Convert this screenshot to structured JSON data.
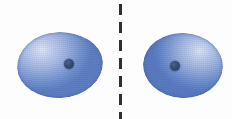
{
  "figure": {
    "type": "scientific-diagram",
    "background_color": "#ffffff",
    "width": 232,
    "height": 119
  },
  "mirror_plane": {
    "name": "mirror-plane",
    "orientation": "vertical",
    "style": "dashed",
    "color": "#2f2f2f",
    "x_position": 120,
    "dash_length": 11,
    "dash_gap": 7,
    "line_width": 3
  },
  "lobes": [
    {
      "id": "left",
      "label": "",
      "fill_color": "#8aa4d6",
      "highlight_color": "#dfe6f6",
      "edge_color": "#5f7fc2",
      "center_x": 60,
      "center_y": 65,
      "width": 86,
      "height": 66,
      "nucleus": {
        "label": "",
        "color": "#2b3f63",
        "x": 69,
        "y": 64,
        "diameter": 10
      }
    },
    {
      "id": "right",
      "label": "",
      "fill_color": "#859fd3",
      "highlight_color": "#dbe3f4",
      "edge_color": "#5b7bc0",
      "center_x": 183,
      "center_y": 65,
      "width": 80,
      "height": 65,
      "nucleus": {
        "label": "",
        "color": "#2b3f63",
        "x": 175,
        "y": 66,
        "diameter": 10
      }
    }
  ],
  "caption": ""
}
